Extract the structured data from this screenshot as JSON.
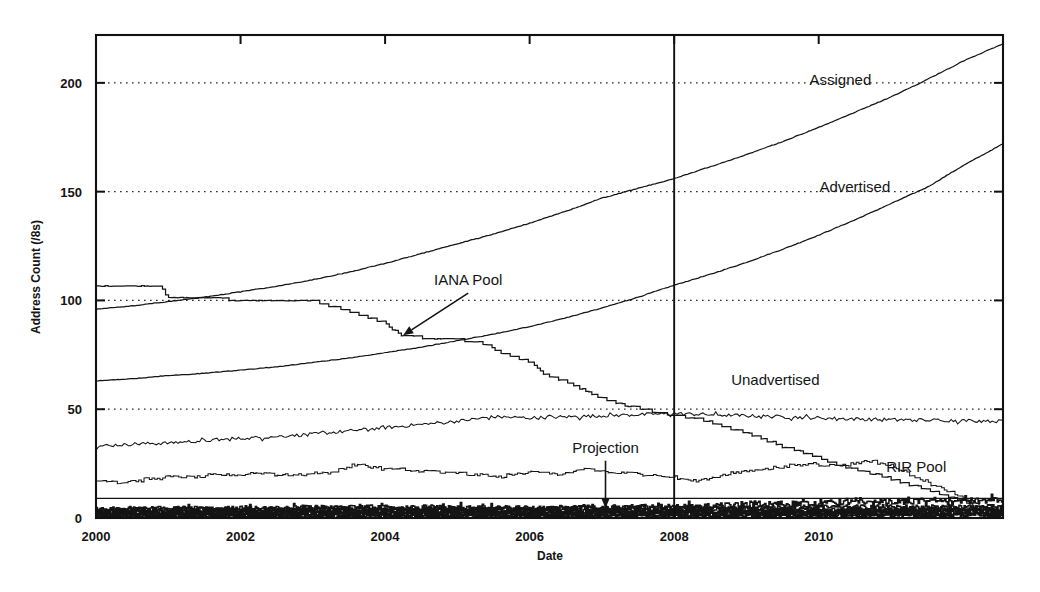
{
  "figure": {
    "name": "ipv4-address-consumption-chart",
    "background_color": "#ffffff",
    "ink_color": "#141414"
  },
  "chart_data": {
    "type": "line",
    "title": "",
    "subtitle": "",
    "xlabel": "Date",
    "ylabel": "Address Count (/8s)",
    "xlim": [
      2000,
      2012.55
    ],
    "ylim": [
      0,
      222
    ],
    "xticks": [
      2000,
      2002,
      2004,
      2006,
      2008,
      2010
    ],
    "xtick_labels": [
      "2000",
      "2002",
      "2004",
      "2006",
      "2008",
      "2010"
    ],
    "yticks": [
      0,
      50,
      100,
      150,
      200
    ],
    "ytick_labels": [
      "0",
      "50",
      "100",
      "150",
      "200"
    ],
    "grid": "horizontal-dotted",
    "legend_position": "inline-annotations",
    "annotations": [
      {
        "label": "Assigned",
        "name": "series-label-assigned",
        "x": 2010.3,
        "y": 199,
        "arrow": false
      },
      {
        "label": "Advertised",
        "name": "series-label-advertised",
        "x": 2010.5,
        "y": 150,
        "arrow": false
      },
      {
        "label": "IANA Pool",
        "name": "series-label-iana-pool",
        "x": 2005.15,
        "y": 107,
        "arrow": true,
        "arrow_to": {
          "x": 2004.25,
          "y": 84
        }
      },
      {
        "label": "Unadvertised",
        "name": "series-label-unadvertised",
        "x": 2009.4,
        "y": 61,
        "arrow": false
      },
      {
        "label": "Projection",
        "name": "series-label-projection",
        "x": 2007.05,
        "y": 30,
        "arrow": true,
        "arrow_to": {
          "x": 2007.05,
          "y": 4.5
        }
      },
      {
        "label": "RIR Pool",
        "name": "series-label-rir-pool",
        "x": 2011.35,
        "y": 21,
        "arrow": false
      }
    ],
    "vertical_marker": {
      "name": "present-day-marker",
      "x": 2008.0,
      "label": ""
    },
    "series": [
      {
        "name": "Assigned",
        "style": "solid",
        "x": [
          2000.0,
          2000.5,
          2001.0,
          2001.5,
          2002.0,
          2002.5,
          2003.0,
          2003.5,
          2004.0,
          2004.5,
          2005.0,
          2005.5,
          2006.0,
          2006.5,
          2007.0,
          2007.5,
          2008.0,
          2008.5,
          2009.0,
          2009.5,
          2010.0,
          2010.5,
          2011.0,
          2011.5,
          2012.0,
          2012.55
        ],
        "values": [
          96.0,
          97.5,
          99.5,
          101.5,
          104.0,
          106.5,
          109.5,
          113.0,
          117.0,
          121.5,
          126.0,
          130.5,
          135.5,
          141.0,
          147.0,
          151.5,
          156.0,
          161.5,
          167.0,
          173.0,
          179.5,
          186.5,
          193.5,
          201.5,
          210.0,
          218.0
        ]
      },
      {
        "name": "Advertised",
        "style": "solid",
        "x": [
          2000.0,
          2000.5,
          2001.0,
          2001.5,
          2002.0,
          2002.5,
          2003.0,
          2003.5,
          2004.0,
          2004.5,
          2005.0,
          2005.5,
          2006.0,
          2006.5,
          2007.0,
          2007.5,
          2008.0,
          2008.5,
          2009.0,
          2009.5,
          2010.0,
          2010.5,
          2011.0,
          2011.5,
          2012.0,
          2012.55
        ],
        "values": [
          63.0,
          64.0,
          65.5,
          66.5,
          68.0,
          69.5,
          71.5,
          73.5,
          76.0,
          78.5,
          81.5,
          84.5,
          88.0,
          92.0,
          96.5,
          101.5,
          107.0,
          112.0,
          117.5,
          123.5,
          130.0,
          137.0,
          144.5,
          152.0,
          162.0,
          172.0
        ]
      },
      {
        "name": "IANA Pool",
        "style": "staircase",
        "x": [
          2000.0,
          2000.9,
          2001.0,
          2001.6,
          2002.1,
          2003.0,
          2003.6,
          2004.0,
          2004.2,
          2004.5,
          2005.0,
          2005.4,
          2005.6,
          2006.0,
          2006.2,
          2006.5,
          2006.8,
          2007.0,
          2007.3,
          2007.6,
          2008.0,
          2008.3,
          2008.7,
          2009.1,
          2009.5,
          2009.9,
          2010.3,
          2010.7,
          2011.0,
          2011.3,
          2011.6,
          2011.9,
          2012.2,
          2012.55
        ],
        "values": [
          107.0,
          107.0,
          101.0,
          101.0,
          100.0,
          100.0,
          94.0,
          90.0,
          84.0,
          83.0,
          82.0,
          80.0,
          76.0,
          72.0,
          66.0,
          63.0,
          58.0,
          55.0,
          52.0,
          50.0,
          47.0,
          46.0,
          42.0,
          38.0,
          33.0,
          29.0,
          24.0,
          21.0,
          18.0,
          15.0,
          12.0,
          9.0,
          5.0,
          2.0
        ]
      },
      {
        "name": "Unadvertised",
        "style": "noisy",
        "x": [
          2000.0,
          2000.5,
          2001.0,
          2001.5,
          2002.0,
          2002.5,
          2003.0,
          2003.5,
          2004.0,
          2004.5,
          2005.0,
          2005.5,
          2006.0,
          2006.5,
          2007.0,
          2007.5,
          2008.0,
          2008.5,
          2009.0,
          2009.5,
          2010.0,
          2010.5,
          2011.0,
          2011.5,
          2012.0,
          2012.55
        ],
        "values": [
          33.0,
          34.0,
          34.5,
          35.5,
          36.5,
          37.5,
          38.5,
          40.0,
          41.5,
          43.0,
          44.5,
          46.5,
          46.0,
          46.5,
          47.0,
          47.5,
          48.0,
          47.5,
          47.0,
          46.5,
          46.0,
          45.5,
          45.2,
          45.0,
          44.8,
          44.5
        ]
      },
      {
        "name": "RIR Pool",
        "style": "staircase-noisy",
        "x": [
          2000.0,
          2000.4,
          2000.9,
          2001.2,
          2001.7,
          2002.2,
          2002.7,
          2003.2,
          2003.6,
          2003.9,
          2004.3,
          2004.8,
          2005.2,
          2005.6,
          2006.0,
          2006.4,
          2006.8,
          2007.1,
          2007.5,
          2007.9,
          2008.3,
          2008.7,
          2009.1,
          2009.5,
          2009.9,
          2010.3,
          2010.7,
          2011.0,
          2011.4,
          2011.8,
          2012.2,
          2012.55
        ],
        "values": [
          17.0,
          16.5,
          18.5,
          19.0,
          19.5,
          20.5,
          20.0,
          20.5,
          24.5,
          23.0,
          22.0,
          21.0,
          20.0,
          19.0,
          21.5,
          20.0,
          22.5,
          21.0,
          20.5,
          19.0,
          17.0,
          20.0,
          22.0,
          23.5,
          25.0,
          24.0,
          26.5,
          24.0,
          18.0,
          12.0,
          6.0,
          1.5
        ]
      },
      {
        "name": "Projection",
        "style": "flat",
        "x": [
          2000.0,
          2006.2,
          2008.4,
          2010.2,
          2012.55
        ],
        "values": [
          9.0,
          9.0,
          9.0,
          9.0,
          9.0
        ]
      },
      {
        "name": "Lower Band A",
        "style": "dense-noisy",
        "x": [
          2000.0,
          2001.0,
          2002.0,
          2003.0,
          2004.0,
          2005.0,
          2006.0,
          2007.0,
          2008.0,
          2009.0,
          2010.0,
          2011.0,
          2012.0,
          2012.55
        ],
        "values": [
          3.5,
          3.5,
          4.0,
          4.5,
          5.0,
          4.5,
          4.0,
          4.5,
          5.0,
          6.0,
          7.0,
          7.5,
          8.0,
          8.0
        ]
      },
      {
        "name": "Lower Band B",
        "style": "dense-noisy",
        "x": [
          2000.0,
          2001.0,
          2002.0,
          2003.0,
          2004.0,
          2005.0,
          2006.0,
          2007.0,
          2008.0,
          2009.0,
          2010.0,
          2011.0,
          2012.0,
          2012.55
        ],
        "values": [
          1.8,
          2.0,
          2.2,
          2.5,
          2.8,
          2.5,
          2.2,
          2.5,
          2.8,
          3.0,
          3.2,
          3.4,
          3.5,
          3.5
        ]
      },
      {
        "name": "Lower Band C",
        "style": "dense-noisy",
        "x": [
          2000.0,
          2001.0,
          2002.0,
          2003.0,
          2004.0,
          2005.0,
          2006.0,
          2007.0,
          2008.0,
          2009.0,
          2010.0,
          2011.0,
          2012.0,
          2012.55
        ],
        "values": [
          0.8,
          0.9,
          1.0,
          1.1,
          1.2,
          1.1,
          1.0,
          1.1,
          1.2,
          1.3,
          1.4,
          1.5,
          1.5,
          1.5
        ]
      }
    ]
  }
}
